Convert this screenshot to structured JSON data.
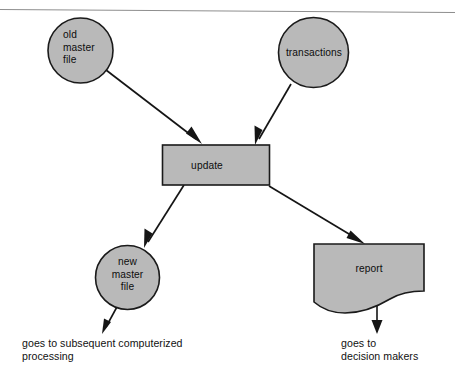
{
  "diagram": {
    "background_color": "#ffffff",
    "node_fill_color": "#b9b9b9",
    "node_stroke_color": "#1a1a1a",
    "arrow_color": "#151515",
    "divider_color": "#8e8e8e",
    "nodes": {
      "old_master_file": {
        "shape": "circle",
        "lines": [
          "old",
          "master",
          "file"
        ],
        "line1": "old",
        "line2": "master",
        "line3": "file"
      },
      "transactions": {
        "shape": "circle",
        "label": "transactions"
      },
      "update": {
        "shape": "rectangle",
        "label": "update"
      },
      "new_master_file": {
        "shape": "circle",
        "lines": [
          "new",
          "master",
          "file"
        ],
        "line1": "new",
        "line2": "master",
        "line3": "file"
      },
      "report": {
        "shape": "document",
        "label": "report"
      }
    },
    "captions": {
      "new_master_file_output": {
        "line1": "goes to subsequent computerized",
        "line2": "processing"
      },
      "report_output": {
        "line1": "goes to",
        "line2": "decision makers"
      }
    },
    "flows": [
      {
        "from": "old master file",
        "to": "update"
      },
      {
        "from": "transactions",
        "to": "update"
      },
      {
        "from": "update",
        "to": "new master file"
      },
      {
        "from": "update",
        "to": "report"
      },
      {
        "from": "new master file",
        "to": "goes to subsequent computerized processing"
      },
      {
        "from": "report",
        "to": "goes to decision makers"
      }
    ]
  }
}
